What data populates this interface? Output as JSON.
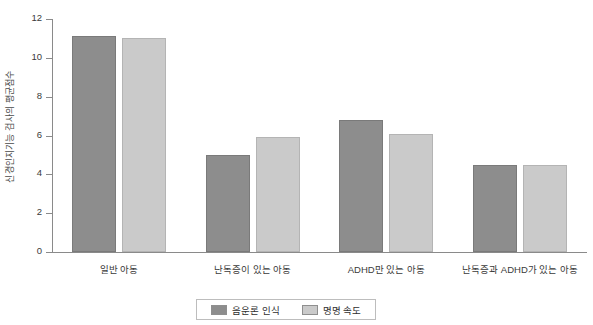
{
  "chart_data": {
    "type": "bar",
    "title": "",
    "subtitle": "",
    "xlabel": "",
    "ylabel": "신경인지기능 검사의 평균점수",
    "ylim": [
      0,
      12
    ],
    "yticks": [
      0,
      2,
      4,
      6,
      8,
      10,
      12
    ],
    "ytick_labels": [
      "0",
      "2",
      "4",
      "6",
      "8",
      "10",
      "12"
    ],
    "grid": false,
    "legend_position": "bottom",
    "categories": [
      "일반 아동",
      "난독증이 있는 아동",
      "ADHD만 있는 아동",
      "난독증과 ADHD가 있는 아동"
    ],
    "series": [
      {
        "name": "음운론 인식",
        "color": "#8d8d8d",
        "values": [
          11.1,
          5.0,
          6.8,
          4.5
        ]
      },
      {
        "name": "명명 속도",
        "color": "#cacaca",
        "values": [
          11.0,
          5.9,
          6.1,
          4.5
        ]
      }
    ]
  },
  "legend": {
    "items": [
      {
        "label": "음운론 인식",
        "series": 0
      },
      {
        "label": "명명 속도",
        "series": 1
      }
    ]
  },
  "colors": {
    "series_0": "#8d8d8d",
    "series_1": "#cacaca",
    "axis": "#8a8a8a",
    "text": "#3a3a3a",
    "background": "#ffffff"
  }
}
